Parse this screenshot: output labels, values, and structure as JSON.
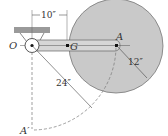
{
  "diagram": {
    "labels": {
      "pivot": "O",
      "center_of_mass": "G",
      "disc_center": "A",
      "lowered_position": "A′",
      "dim_OG": "10″",
      "dim_radius": "12″",
      "dim_OA": "24″"
    },
    "colors": {
      "disc": "#c9c9c9",
      "arm": "#d6d6d6",
      "line": "#444444",
      "ceiling": "#9a9a9a"
    }
  }
}
